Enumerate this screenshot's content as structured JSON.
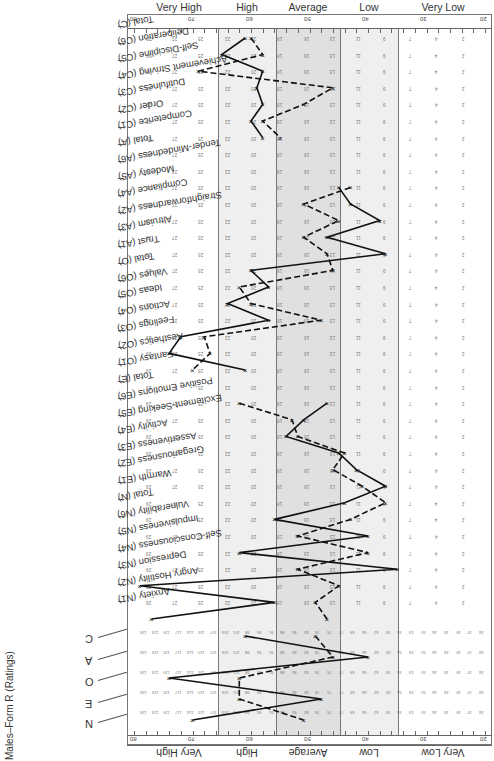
{
  "form": {
    "title": "Males–Form R (Ratings)",
    "orientation": "rotated 180 degrees"
  },
  "bands": [
    {
      "label": "Very High",
      "t_range": [
        65.5,
        80
      ]
    },
    {
      "label": "High",
      "t_range": [
        55.5,
        65.5
      ]
    },
    {
      "label": "Average",
      "t_range": [
        44.5,
        55.5
      ]
    },
    {
      "label": "Low",
      "t_range": [
        34.5,
        44.5
      ]
    },
    {
      "label": "Very Low",
      "t_range": [
        20,
        34.5
      ]
    }
  ],
  "axis": {
    "tick_labels": [
      "80",
      "70",
      "60",
      "50",
      "40",
      "30",
      "20"
    ],
    "min": 20,
    "max": 80
  },
  "domains_summary": [
    "N",
    "E",
    "O",
    "A",
    "C"
  ],
  "colors": {
    "high_shade": "#efefef",
    "average_shade": "#e2e2e2",
    "low_shade": "#efefef",
    "line": "#111111",
    "grid_text": "#777777"
  },
  "chart_data": {
    "type": "line",
    "title": "Males–Form R (Ratings)",
    "xlabel": "T-score",
    "ylabel": "Facet / Domain",
    "xlim": [
      80,
      20
    ],
    "grid": false,
    "legend": {
      "entries": [
        "solid line (profile 1)",
        "dashed line (profile 2)"
      ],
      "position": "none"
    },
    "categories": [
      "Total (C)",
      "Deliberation (C6)",
      "Self-Discipline (C5)",
      "Achievement Striving (C4)",
      "Dutifulness (C3)",
      "Order (C2)",
      "Competence (C1)",
      "Total (A)",
      "Tender-Mindedness (A6)",
      "Modesty (A5)",
      "Compliance (A4)",
      "Straightforwardness (A2)",
      "Altruism (A3)",
      "Trust (A1)",
      "Total (O)",
      "Values (O6)",
      "Ideas (O5)",
      "Actions (O4)",
      "Feelings (O3)",
      "Aesthetics (O2)",
      "Fantasy (O1)",
      "Total (E)",
      "Positive Emotions (E6)",
      "Excitement-Seeking (E5)",
      "Activity (E4)",
      "Assertiveness (E3)",
      "Gregariousness (E2)",
      "Warmth (E1)",
      "Total (N)",
      "Vulnerability (N6)",
      "Impulsiveness (N5)",
      "Self-Consciousness (N4)",
      "Depression (N3)",
      "Angry Hostility (N2)",
      "Anxiety (N1)"
    ],
    "domain_rows": [
      "C",
      "A",
      "O",
      "E",
      "N"
    ],
    "series": [
      {
        "name": "Profile 1 (solid)",
        "style": "solid",
        "facet_t": [
          61,
          65,
          58,
          59,
          58,
          60,
          58,
          null,
          null,
          45,
          43,
          38,
          47,
          37,
          60,
          57,
          64,
          57,
          72,
          74,
          61,
          null,
          47,
          51,
          54,
          45,
          42,
          37,
          44,
          56,
          40,
          62,
          35,
          79,
          56,
          77
        ],
        "domain_t": {
          "N": 70,
          "E": 48,
          "O": 74,
          "A": 40,
          "C": 61
        }
      },
      {
        "name": "Profile 2 (dashed)",
        "style": "dashed",
        "facet_t": [
          60,
          58,
          69,
          46,
          51,
          58,
          55,
          null,
          null,
          43,
          51,
          45,
          51,
          47,
          46,
          62,
          60,
          48,
          68,
          67,
          70,
          null,
          62,
          53,
          52,
          44,
          46,
          41,
          37,
          43,
          52,
          40,
          52,
          45,
          49,
          47
        ],
        "domain_t": {
          "N": 51,
          "E": 62,
          "O": 62,
          "A": 46,
          "C": 49
        }
      }
    ]
  }
}
